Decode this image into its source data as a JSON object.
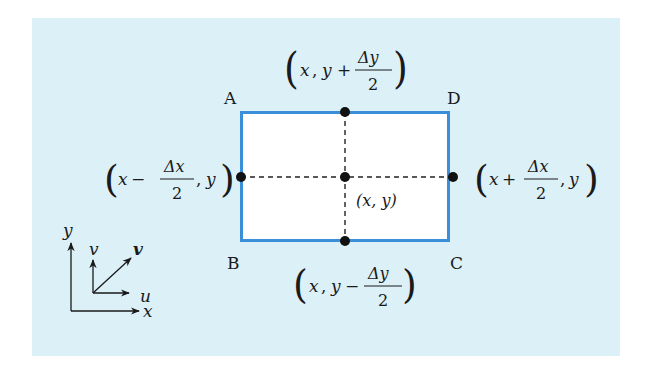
{
  "colors": {
    "panel_bg": "#dcf0f8",
    "rect_fill": "#ffffff",
    "rect_stroke": "#3a8fd8",
    "ink": "#1a1a1a"
  },
  "rectangle": {
    "corners": {
      "A": "A",
      "B": "B",
      "C": "C",
      "D": "D"
    }
  },
  "points": {
    "top": {
      "open": "(",
      "x": "x",
      "comma": ",",
      "y": "y",
      "op": "+",
      "num": "Δy",
      "den": "2",
      "close": ")"
    },
    "bottom": {
      "open": "(",
      "x": "x",
      "comma": ",",
      "y": "y",
      "op": "−",
      "num": "Δy",
      "den": "2",
      "close": ")"
    },
    "left": {
      "open": "(",
      "x": "x",
      "op": "−",
      "num": "Δx",
      "den": "2",
      "comma": ",",
      "y": "y",
      "close": ")"
    },
    "right": {
      "open": "(",
      "x": "x",
      "op": "+",
      "num": "Δx",
      "den": "2",
      "comma": ",",
      "y": "y",
      "close": ")"
    },
    "center": {
      "label": "(x, y)"
    }
  },
  "axes": {
    "x_label": "x",
    "y_label": "y",
    "u_label": "u",
    "v_label": "v",
    "vec_label": "v"
  }
}
